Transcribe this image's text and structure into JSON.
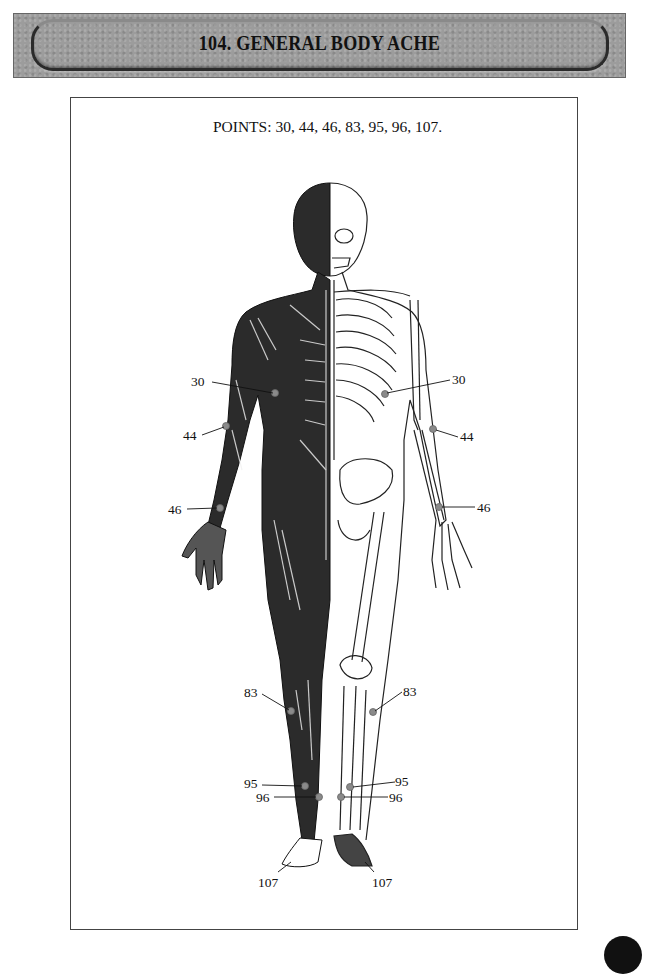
{
  "header": {
    "number": "104.",
    "title": "104.  GENERAL BODY ACHE"
  },
  "diagram": {
    "points_caption": "POINTS: 30, 44, 46, 83, 95, 96, 107.",
    "figure": "anatomical-body-front-muscle-skeleton-split",
    "marker_color": "#8a8a8a",
    "labels": {
      "p30_left": "30",
      "p30_right": "30",
      "p44_left": "44",
      "p44_right": "44",
      "p46_left": "46",
      "p46_right": "46",
      "p83_left": "83",
      "p83_right": "83",
      "p95_left": "95",
      "p95_right": "95",
      "p96_left": "96",
      "p96_right": "96",
      "p107_left": "107",
      "p107_right": "107"
    }
  }
}
